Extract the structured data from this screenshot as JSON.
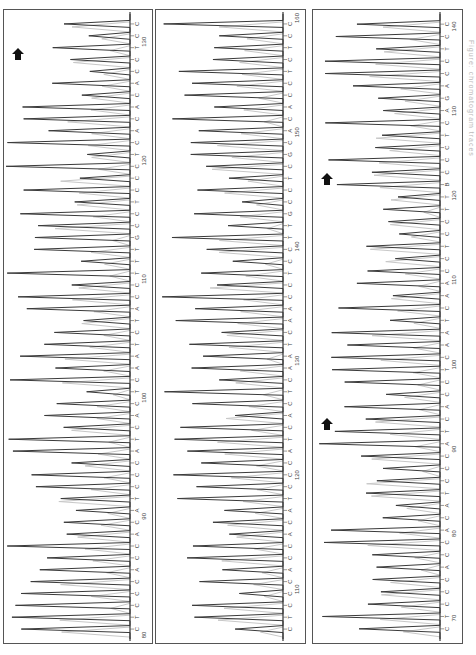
{
  "chart_data": {
    "type": "line",
    "orientation": "rotated-90-clockwise; sequence position increases from bottom to top; signal intensity increases leftward",
    "trace_colors": {
      "primary": "#3a3a3a",
      "secondary": "#c8c8c8"
    },
    "panels": [
      {
        "id": "panel-1",
        "start_pos": 80,
        "end_pos": 132,
        "position_ticks": [
          80,
          90,
          100,
          110,
          120,
          130
        ],
        "sequence": "CTCCCACCACATCCCATCACTCAATCTACCTTTGCCTCCCTCACACACCTCC",
        "arrows": [
          {
            "position": 129
          }
        ]
      },
      {
        "id": "panel-2",
        "start_pos": 106,
        "end_pos": 160,
        "position_ticks": [
          110,
          120,
          130,
          140,
          150,
          160
        ],
        "sequence": "CTCCCACCACATCCCATCACTCAATCAACCTCCTTGCCTCGCACACCTCTCC",
        "arrows": []
      },
      {
        "id": "panel-3",
        "start_pos": 68,
        "end_pos": 141,
        "position_ticks": [
          70,
          80,
          90,
          100,
          110,
          120,
          130,
          140
        ],
        "sequence": "CTCCCACCACATCCCATCACCTCAATCAACCTCCTTBCCCTCAGACCTCC",
        "arrows": [
          {
            "position": 93
          },
          {
            "position": 122
          }
        ]
      }
    ],
    "xlabel": "Base position",
    "ylabel": "Fluorescence intensity",
    "grid": false,
    "legend": null
  },
  "caption": "Figure: chromatogram traces"
}
